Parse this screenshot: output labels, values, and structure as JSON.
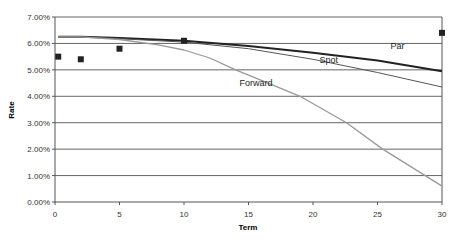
{
  "chart_data": {
    "type": "line",
    "title": "",
    "xlabel": "Term",
    "ylabel": "Rate",
    "xlim": [
      0,
      30
    ],
    "ylim": [
      0,
      0.07
    ],
    "x_ticks": [
      "0",
      "5",
      "10",
      "15",
      "20",
      "25",
      "30"
    ],
    "y_ticks": [
      "0.00%",
      "1.00%",
      "2.00%",
      "3.00%",
      "4.00%",
      "5.00%",
      "6.00%",
      "7.00%"
    ],
    "grid": "horizontal",
    "legend": "inline labels",
    "series": [
      {
        "name": "Par",
        "style": "line",
        "color": "#222222",
        "x": [
          0.25,
          2,
          5,
          10,
          15,
          20,
          25,
          30
        ],
        "y": [
          6.25,
          6.25,
          6.2,
          6.1,
          5.9,
          5.65,
          5.35,
          4.95
        ]
      },
      {
        "name": "Spot",
        "style": "line",
        "color": "#555555",
        "x": [
          0.25,
          2,
          5,
          10,
          15,
          20,
          25,
          30
        ],
        "y": [
          6.25,
          6.25,
          6.18,
          6.05,
          5.8,
          5.4,
          4.9,
          4.35
        ]
      },
      {
        "name": "Forward",
        "style": "line",
        "color": "#999999",
        "x": [
          0.25,
          2,
          5,
          8,
          10,
          12,
          14,
          16,
          19,
          22.6,
          25.4,
          28.7,
          30
        ],
        "y": [
          6.25,
          6.25,
          6.15,
          5.95,
          5.75,
          5.45,
          5.0,
          4.6,
          4.0,
          3.0,
          2.0,
          1.0,
          0.6
        ]
      },
      {
        "name": "Market",
        "style": "markers",
        "color": "#222222",
        "x": [
          0.25,
          2,
          5,
          10,
          30
        ],
        "y": [
          5.5,
          5.4,
          5.8,
          6.1,
          6.4
        ]
      }
    ],
    "annotations": [
      {
        "text": "Par",
        "x": 26,
        "y": 5.8
      },
      {
        "text": "Spot",
        "x": 20.5,
        "y": 5.25
      },
      {
        "text": "Forward",
        "x": 14.3,
        "y": 4.4
      }
    ]
  }
}
